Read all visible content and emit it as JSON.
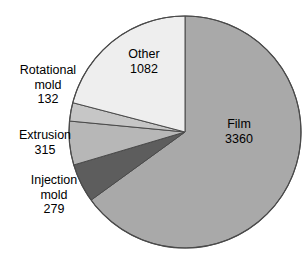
{
  "chart_data": {
    "type": "pie",
    "title": "",
    "subtitle": "",
    "xlabel": "",
    "ylabel": "",
    "legend_position": "none",
    "grid": false,
    "total": 5168,
    "units": "",
    "start_angle_deg": 0,
    "direction": "clockwise",
    "categories": [
      "Film",
      "Injection mold",
      "Extrusion",
      "Rotational mold",
      "Other"
    ],
    "values": [
      3360,
      279,
      315,
      132,
      1082
    ],
    "slices": [
      {
        "name": "Film",
        "value": 3360,
        "label": "Film",
        "value_text": "3360",
        "percent": 65.0,
        "color": "#a9a9a9",
        "label_placement": "inside"
      },
      {
        "name": "Injection mold",
        "value": 279,
        "label": "Injection mold",
        "label_line1": "Injection",
        "label_line2": "mold",
        "value_text": "279",
        "percent": 5.4,
        "color": "#5d5d5d",
        "label_placement": "outside"
      },
      {
        "name": "Extrusion",
        "value": 315,
        "label": "Extrusion",
        "label_line1": "Extrusion",
        "label_line2": "",
        "value_text": "315",
        "percent": 6.1,
        "color": "#b7b7b7",
        "label_placement": "outside"
      },
      {
        "name": "Rotational mold",
        "value": 132,
        "label": "Rotational mold",
        "label_line1": "Rotational",
        "label_line2": "mold",
        "value_text": "132",
        "percent": 2.6,
        "color": "#c6c6c6",
        "label_placement": "outside"
      },
      {
        "name": "Other",
        "value": 1082,
        "label": "Other",
        "value_text": "1082",
        "percent": 20.9,
        "color": "#eeeeee",
        "label_placement": "inside"
      }
    ],
    "geometry": {
      "center_x": 185,
      "center_y": 132,
      "radius": 116
    },
    "style": {
      "background": "#ffffff",
      "outline_color": "#4a4a4a",
      "text_color": "#000000"
    }
  },
  "labels": {
    "film": {
      "name": "Film",
      "value": "3360"
    },
    "other": {
      "name": "Other",
      "value": "1082"
    },
    "rotational": {
      "line1": "Rotational",
      "line2": "mold",
      "value": "132"
    },
    "extrusion": {
      "line1": "Extrusion",
      "value": "315"
    },
    "injection": {
      "line1": "Injection",
      "line2": "mold",
      "value": "279"
    }
  }
}
